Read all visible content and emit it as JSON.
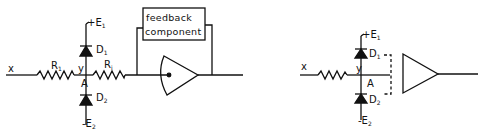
{
  "figure": {
    "panels": [
      {
        "id": "left",
        "input_label": "x",
        "junction_label": "y",
        "node_label": "A",
        "resistors": [
          {
            "name": "R",
            "sub": "1"
          },
          {
            "name": "R",
            "sub": "i"
          }
        ],
        "diodes": [
          {
            "name": "D",
            "sub": "1",
            "supply_sign": "+",
            "supply": "E",
            "supply_sub": "1"
          },
          {
            "name": "D",
            "sub": "2",
            "supply_sign": "-",
            "supply": "E",
            "supply_sub": "2"
          }
        ],
        "feedback_box": {
          "line1": "feedback",
          "line2": "component"
        },
        "amplifier": "integrator-style amplifier with input dot"
      },
      {
        "id": "right",
        "input_label": "x",
        "junction_label": "y",
        "node_label": "A",
        "diodes": [
          {
            "name": "D",
            "sub": "1",
            "supply_sign": "+",
            "supply": "E",
            "supply_sub": "1"
          },
          {
            "name": "D",
            "sub": "2",
            "supply_sign": "-",
            "supply": "E",
            "supply_sub": "2"
          }
        ],
        "amplifier": "triangle amplifier with dashed input bracket"
      }
    ]
  },
  "colors": {
    "ink": "#111111",
    "background": "#ffffff"
  }
}
